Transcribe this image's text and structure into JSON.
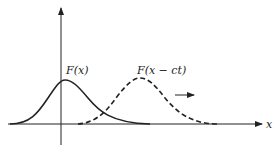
{
  "diagram": {
    "labels": {
      "static_wave": "F(x)",
      "moving_wave": "F(x − ct)",
      "x_axis": "x"
    },
    "colors": {
      "ink": "#222222",
      "background": "#ffffff"
    },
    "curves": [
      {
        "name": "F(x)",
        "style": "solid",
        "peak_x": 65,
        "peak_y": 80
      },
      {
        "name": "F(x - ct)",
        "style": "dashed",
        "peak_x": 140,
        "peak_y": 78
      }
    ],
    "motion_arrow": {
      "direction": "right"
    }
  }
}
